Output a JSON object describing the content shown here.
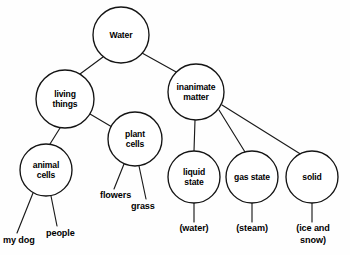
{
  "diagram": {
    "type": "concept-map-tree",
    "title_node": "Water",
    "background_color": "#fefefe",
    "line_color": "#141414",
    "node_fill": "#ffffff",
    "nodes": [
      {
        "id": "water",
        "label_lines": [
          "Water"
        ],
        "cx": 121,
        "cy": 35,
        "r": 28
      },
      {
        "id": "living",
        "label_lines": [
          "living",
          "things"
        ],
        "cx": 65,
        "cy": 99,
        "r": 29
      },
      {
        "id": "inanimate",
        "label_lines": [
          "inanimate",
          "matter"
        ],
        "cx": 196,
        "cy": 92,
        "r": 28
      },
      {
        "id": "plant",
        "label_lines": [
          "plant",
          "cells"
        ],
        "cx": 135,
        "cy": 139,
        "r": 27
      },
      {
        "id": "animal",
        "label_lines": [
          "animal",
          "cells"
        ],
        "cx": 46,
        "cy": 170,
        "r": 26
      },
      {
        "id": "liquid",
        "label_lines": [
          "liquid",
          "state"
        ],
        "cx": 194,
        "cy": 177,
        "r": 26
      },
      {
        "id": "gas",
        "label_lines": [
          "gas state"
        ],
        "cx": 252,
        "cy": 177,
        "r": 26
      },
      {
        "id": "solid",
        "label_lines": [
          "solid"
        ],
        "cx": 312,
        "cy": 177,
        "r": 26
      }
    ],
    "leaf_labels": [
      {
        "id": "my-dog",
        "lines": [
          "my dog"
        ],
        "x": 3,
        "y": 243,
        "anchor": "start"
      },
      {
        "id": "people",
        "lines": [
          "people"
        ],
        "x": 46,
        "y": 236,
        "anchor": "start"
      },
      {
        "id": "flowers",
        "lines": [
          "flowers"
        ],
        "x": 100,
        "y": 198,
        "anchor": "start"
      },
      {
        "id": "grass",
        "lines": [
          "grass"
        ],
        "x": 131,
        "y": 209,
        "anchor": "start"
      },
      {
        "id": "water-p",
        "lines": [
          "(water)"
        ],
        "x": 194,
        "y": 231,
        "anchor": "middle"
      },
      {
        "id": "steam-p",
        "lines": [
          "(steam)"
        ],
        "x": 252,
        "y": 231,
        "anchor": "middle"
      },
      {
        "id": "ice-p",
        "lines": [
          "(ice and",
          "snow)"
        ],
        "x": 313,
        "y": 231,
        "anchor": "middle"
      }
    ],
    "edges": [
      {
        "id": "water-living",
        "from": "water",
        "to": "living",
        "x1": 103,
        "y1": 57,
        "x2": 80,
        "y2": 74
      },
      {
        "id": "water-inanimate",
        "from": "water",
        "to": "inanimate",
        "x1": 142,
        "y1": 53,
        "x2": 178,
        "y2": 73
      },
      {
        "id": "living-animal",
        "from": "living",
        "to": "animal",
        "x1": 60,
        "y1": 128,
        "x2": 50,
        "y2": 144
      },
      {
        "id": "living-plant",
        "from": "living",
        "to": "plant",
        "x1": 90,
        "y1": 114,
        "x2": 112,
        "y2": 127
      },
      {
        "id": "animal-mydog",
        "from": "animal",
        "to": "my-dog",
        "x1": 33,
        "y1": 193,
        "x2": 17,
        "y2": 233
      },
      {
        "id": "animal-people",
        "from": "animal",
        "to": "people",
        "x1": 51,
        "y1": 196,
        "x2": 57,
        "y2": 226
      },
      {
        "id": "plant-flowers",
        "from": "plant",
        "to": "flowers",
        "x1": 124,
        "y1": 164,
        "x2": 114,
        "y2": 189
      },
      {
        "id": "plant-grass",
        "from": "plant",
        "to": "grass",
        "x1": 139,
        "y1": 166,
        "x2": 146,
        "y2": 199
      },
      {
        "id": "inanimate-liquid",
        "from": "inanimate",
        "to": "liquid",
        "x1": 195,
        "y1": 120,
        "x2": 194,
        "y2": 151
      },
      {
        "id": "inanimate-gas",
        "from": "inanimate",
        "to": "gas",
        "x1": 219,
        "y1": 110,
        "x2": 245,
        "y2": 152
      },
      {
        "id": "inanimate-solid",
        "from": "inanimate",
        "to": "solid",
        "x1": 222,
        "y1": 105,
        "x2": 302,
        "y2": 155
      },
      {
        "id": "liquid-water",
        "from": "liquid",
        "to": "water-p",
        "x1": 194,
        "y1": 203,
        "x2": 194,
        "y2": 222
      },
      {
        "id": "gas-steam",
        "from": "gas",
        "to": "steam-p",
        "x1": 252,
        "y1": 203,
        "x2": 252,
        "y2": 222
      },
      {
        "id": "solid-ice",
        "from": "solid",
        "to": "ice-p",
        "x1": 312,
        "y1": 203,
        "x2": 312,
        "y2": 222
      }
    ]
  }
}
